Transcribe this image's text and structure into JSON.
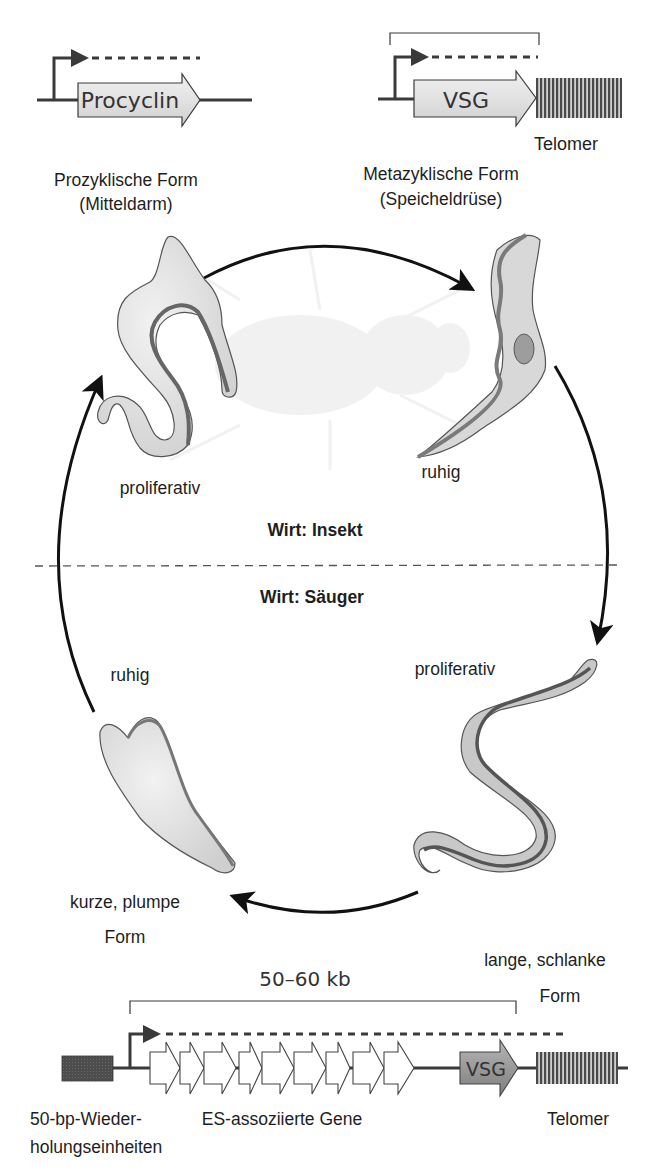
{
  "figure": {
    "type": "life-cycle-diagram"
  },
  "top_left_gene": {
    "gene_label": "Procyclin",
    "promoter": "transcription-start-arrow",
    "transcript": "dashed-line"
  },
  "top_right_gene": {
    "gene_label": "VSG",
    "telomere_label": "Telomer",
    "promoter": "transcription-start-arrow",
    "transcript": "dashed-line"
  },
  "stages": {
    "procyclic": {
      "name": "Prozyklische Form",
      "location": "(Mitteldarm)",
      "state": "proliferativ"
    },
    "metacyclic": {
      "name": "Metazyklische Form",
      "location": "(Speicheldrüse)",
      "state": "ruhig"
    },
    "long_slender": {
      "name_line1": "lange, schlanke",
      "name_line2": "Form",
      "state": "proliferativ"
    },
    "short_stumpy": {
      "name_line1": "kurze, plumpe",
      "name_line2": "Form",
      "state": "ruhig"
    }
  },
  "hosts": {
    "insect": "Wirt: Insekt",
    "mammal": "Wirt: Säuger"
  },
  "expression_site": {
    "size_label": "50–60 kb",
    "repeats_label_line1": "50-bp-Wieder-",
    "repeats_label_line2": "holungseinheiten",
    "esag_label": "ES-assoziierte Gene",
    "esag_count": 9,
    "vsg_label": "VSG",
    "telomere_label": "Telomer"
  },
  "colors": {
    "line": "#3a3a3a",
    "gene_fill": "#d9d9d9",
    "cell_fill": "#dcdcdc",
    "flagellum": "#6e6e6e",
    "vsg_dark": "#8a8a8a",
    "repeat_box": "#555555"
  }
}
